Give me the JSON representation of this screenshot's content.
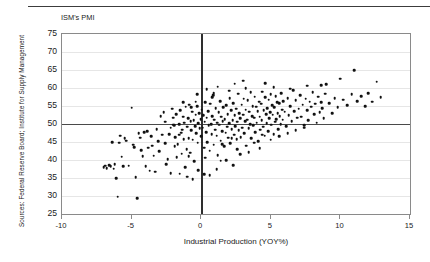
{
  "figure": {
    "source_note": "Sources: Federal Reserve Board; Institute for Supply Management",
    "title_label": "ISM's PMI"
  },
  "chart_data": {
    "type": "scatter",
    "title": "ISM's PMI",
    "xlabel": "Industrial Production (YOY%)",
    "ylabel": "ISM's PMI",
    "xlim": [
      -10,
      15
    ],
    "ylim": [
      25,
      75
    ],
    "xticks": [
      -10,
      -5,
      0,
      5,
      10,
      15
    ],
    "xtick_labels": [
      "-10",
      "-5",
      "0",
      "5",
      "10",
      "15"
    ],
    "yticks": [
      25,
      30,
      35,
      40,
      45,
      50,
      55,
      60,
      65,
      70,
      75
    ],
    "ytick_labels": [
      "25",
      "30",
      "35",
      "40",
      "45",
      "50",
      "55",
      "60",
      "65",
      "70",
      "75"
    ],
    "grid": "horizontal",
    "legend": "none",
    "reference_lines": [
      {
        "axis": "y",
        "value": 50
      },
      {
        "axis": "x",
        "value": 0
      }
    ],
    "marker": {
      "shape": "circle",
      "color": "#111111",
      "size": 2.6
    },
    "points": [
      [
        -7.0,
        38.0
      ],
      [
        -6.9,
        38.4
      ],
      [
        -6.8,
        37.8
      ],
      [
        -6.6,
        38.6
      ],
      [
        -6.5,
        38.2
      ],
      [
        -6.4,
        45.0
      ],
      [
        -6.3,
        37.6
      ],
      [
        -6.2,
        38.8
      ],
      [
        -6.1,
        35.0
      ],
      [
        -6.0,
        29.8
      ],
      [
        -5.9,
        44.8
      ],
      [
        -5.8,
        46.8
      ],
      [
        -5.7,
        40.9
      ],
      [
        -5.6,
        38.2
      ],
      [
        -5.5,
        46.0
      ],
      [
        -5.4,
        45.4
      ],
      [
        -5.2,
        38.4
      ],
      [
        -5.0,
        54.5
      ],
      [
        -4.9,
        44.2
      ],
      [
        -4.8,
        43.6
      ],
      [
        -4.7,
        35.2
      ],
      [
        -4.6,
        29.4
      ],
      [
        -4.5,
        47.4
      ],
      [
        -4.4,
        46.2
      ],
      [
        -4.3,
        42.8
      ],
      [
        -4.2,
        41.0
      ],
      [
        -4.1,
        47.8
      ],
      [
        -4.0,
        38.2
      ],
      [
        -3.9,
        48.0
      ],
      [
        -3.8,
        43.4
      ],
      [
        -3.7,
        37.0
      ],
      [
        -3.6,
        46.6
      ],
      [
        -3.5,
        44.0
      ],
      [
        -3.4,
        41.2
      ],
      [
        -3.3,
        36.8
      ],
      [
        -3.2,
        48.6
      ],
      [
        -3.1,
        45.2
      ],
      [
        -3.0,
        42.4
      ],
      [
        -2.9,
        52.2
      ],
      [
        -2.8,
        47.0
      ],
      [
        -2.7,
        53.2
      ],
      [
        -2.6,
        44.6
      ],
      [
        -2.5,
        38.8
      ],
      [
        -2.4,
        40.2
      ],
      [
        -2.3,
        47.2
      ],
      [
        -2.2,
        36.4
      ],
      [
        -2.1,
        54.2
      ],
      [
        -2.0,
        49.8
      ],
      [
        -1.95,
        49.6
      ],
      [
        -1.9,
        43.8
      ],
      [
        -1.85,
        46.4
      ],
      [
        -1.8,
        52.8
      ],
      [
        -1.75,
        40.8
      ],
      [
        -1.7,
        44.4
      ],
      [
        -1.6,
        50.0
      ],
      [
        -1.55,
        36.2
      ],
      [
        -1.5,
        53.8
      ],
      [
        -1.45,
        47.6
      ],
      [
        -1.4,
        41.8
      ],
      [
        -1.35,
        48.4
      ],
      [
        -1.3,
        52.0
      ],
      [
        -1.25,
        45.8
      ],
      [
        -1.2,
        50.4
      ],
      [
        -1.15,
        38.0
      ],
      [
        -1.1,
        54.8
      ],
      [
        -1.05,
        43.0
      ],
      [
        -1.0,
        49.2
      ],
      [
        -0.95,
        51.6
      ],
      [
        -0.9,
        46.0
      ],
      [
        -0.85,
        55.4
      ],
      [
        -0.8,
        42.0
      ],
      [
        -0.75,
        50.8
      ],
      [
        -0.7,
        48.2
      ],
      [
        -0.65,
        53.4
      ],
      [
        -0.6,
        45.6
      ],
      [
        -0.55,
        51.0
      ],
      [
        -0.5,
        39.6
      ],
      [
        -0.45,
        49.4
      ],
      [
        -0.4,
        52.6
      ],
      [
        -0.35,
        47.4
      ],
      [
        -0.3,
        55.0
      ],
      [
        -0.25,
        44.8
      ],
      [
        -0.2,
        50.2
      ],
      [
        -0.15,
        53.0
      ],
      [
        -0.1,
        48.8
      ],
      [
        -0.05,
        51.4
      ],
      [
        0.0,
        46.6
      ],
      [
        0.05,
        54.0
      ],
      [
        0.1,
        49.0
      ],
      [
        0.15,
        52.4
      ],
      [
        0.2,
        43.4
      ],
      [
        0.25,
        50.6
      ],
      [
        0.3,
        56.0
      ],
      [
        0.35,
        47.8
      ],
      [
        0.4,
        51.8
      ],
      [
        0.45,
        45.0
      ],
      [
        0.5,
        53.6
      ],
      [
        0.55,
        49.6
      ],
      [
        0.6,
        42.6
      ],
      [
        0.65,
        55.6
      ],
      [
        0.7,
        50.0
      ],
      [
        0.75,
        47.2
      ],
      [
        0.8,
        52.2
      ],
      [
        0.85,
        58.0
      ],
      [
        0.9,
        44.2
      ],
      [
        0.95,
        51.2
      ],
      [
        1.0,
        48.4
      ],
      [
        1.05,
        54.4
      ],
      [
        1.1,
        46.8
      ],
      [
        1.15,
        50.4
      ],
      [
        1.2,
        41.4
      ],
      [
        1.25,
        53.2
      ],
      [
        1.3,
        49.8
      ],
      [
        1.35,
        56.4
      ],
      [
        1.4,
        45.4
      ],
      [
        1.45,
        52.0
      ],
      [
        1.5,
        48.0
      ],
      [
        1.55,
        50.8
      ],
      [
        1.6,
        54.6
      ],
      [
        1.65,
        43.8
      ],
      [
        1.7,
        51.4
      ],
      [
        1.75,
        47.6
      ],
      [
        1.8,
        55.2
      ],
      [
        1.85,
        49.2
      ],
      [
        1.9,
        52.8
      ],
      [
        1.95,
        46.2
      ],
      [
        2.0,
        50.2
      ],
      [
        2.05,
        57.2
      ],
      [
        2.1,
        44.6
      ],
      [
        2.15,
        53.8
      ],
      [
        2.2,
        48.6
      ],
      [
        2.25,
        51.0
      ],
      [
        2.3,
        55.8
      ],
      [
        2.35,
        47.0
      ],
      [
        2.4,
        52.4
      ],
      [
        2.45,
        49.4
      ],
      [
        2.5,
        54.2
      ],
      [
        2.55,
        45.8
      ],
      [
        2.6,
        50.6
      ],
      [
        2.65,
        58.4
      ],
      [
        2.7,
        48.2
      ],
      [
        2.75,
        53.0
      ],
      [
        2.8,
        51.6
      ],
      [
        2.85,
        46.4
      ],
      [
        2.9,
        55.4
      ],
      [
        2.95,
        49.0
      ],
      [
        3.0,
        52.6
      ],
      [
        3.05,
        57.0
      ],
      [
        3.1,
        47.4
      ],
      [
        3.15,
        50.8
      ],
      [
        3.2,
        54.0
      ],
      [
        3.25,
        44.0
      ],
      [
        3.3,
        51.2
      ],
      [
        3.35,
        56.6
      ],
      [
        3.4,
        48.8
      ],
      [
        3.45,
        53.4
      ],
      [
        3.5,
        50.0
      ],
      [
        3.55,
        58.8
      ],
      [
        3.6,
        46.0
      ],
      [
        3.65,
        52.2
      ],
      [
        3.7,
        55.0
      ],
      [
        3.75,
        49.6
      ],
      [
        3.8,
        51.8
      ],
      [
        3.85,
        57.6
      ],
      [
        3.9,
        47.8
      ],
      [
        3.95,
        54.8
      ],
      [
        4.0,
        50.4
      ],
      [
        4.05,
        53.6
      ],
      [
        4.1,
        45.2
      ],
      [
        4.15,
        56.2
      ],
      [
        4.2,
        52.0
      ],
      [
        4.25,
        48.4
      ],
      [
        4.3,
        55.6
      ],
      [
        4.35,
        51.0
      ],
      [
        4.4,
        59.0
      ],
      [
        4.45,
        49.2
      ],
      [
        4.5,
        53.8
      ],
      [
        4.55,
        46.8
      ],
      [
        4.6,
        57.4
      ],
      [
        4.65,
        52.8
      ],
      [
        4.7,
        50.2
      ],
      [
        4.75,
        54.4
      ],
      [
        4.8,
        48.0
      ],
      [
        4.85,
        56.8
      ],
      [
        4.9,
        51.6
      ],
      [
        4.95,
        53.2
      ],
      [
        5.0,
        58.2
      ],
      [
        5.05,
        49.8
      ],
      [
        5.1,
        55.2
      ],
      [
        5.15,
        52.6
      ],
      [
        5.2,
        47.2
      ],
      [
        5.25,
        54.6
      ],
      [
        5.3,
        50.6
      ],
      [
        5.35,
        57.8
      ],
      [
        5.4,
        51.4
      ],
      [
        5.45,
        56.0
      ],
      [
        5.5,
        53.0
      ],
      [
        5.55,
        48.6
      ],
      [
        5.6,
        55.8
      ],
      [
        5.65,
        52.2
      ],
      [
        5.7,
        50.0
      ],
      [
        5.75,
        58.6
      ],
      [
        5.8,
        54.0
      ],
      [
        5.85,
        51.2
      ],
      [
        5.9,
        56.4
      ],
      [
        6.0,
        53.4
      ],
      [
        6.1,
        49.4
      ],
      [
        6.2,
        57.2
      ],
      [
        6.3,
        52.4
      ],
      [
        6.4,
        55.0
      ],
      [
        6.5,
        50.8
      ],
      [
        6.6,
        59.4
      ],
      [
        6.7,
        53.6
      ],
      [
        6.8,
        56.6
      ],
      [
        6.9,
        51.8
      ],
      [
        7.0,
        54.2
      ],
      [
        7.1,
        58.0
      ],
      [
        7.2,
        52.0
      ],
      [
        7.3,
        55.4
      ],
      [
        7.4,
        49.0
      ],
      [
        7.5,
        57.0
      ],
      [
        7.6,
        53.8
      ],
      [
        7.7,
        51.0
      ],
      [
        7.8,
        56.2
      ],
      [
        7.9,
        54.8
      ],
      [
        8.0,
        58.8
      ],
      [
        8.1,
        52.8
      ],
      [
        8.2,
        55.6
      ],
      [
        8.3,
        50.4
      ],
      [
        8.4,
        57.6
      ],
      [
        8.5,
        53.2
      ],
      [
        8.6,
        56.0
      ],
      [
        8.7,
        54.4
      ],
      [
        8.8,
        51.6
      ],
      [
        8.9,
        58.4
      ],
      [
        9.0,
        61.0
      ],
      [
        9.2,
        55.8
      ],
      [
        9.4,
        53.0
      ],
      [
        9.6,
        57.2
      ],
      [
        9.8,
        54.6
      ],
      [
        10.0,
        62.6
      ],
      [
        10.2,
        56.8
      ],
      [
        10.5,
        55.2
      ],
      [
        10.8,
        58.2
      ],
      [
        11.0,
        65.0
      ],
      [
        11.2,
        56.4
      ],
      [
        11.5,
        57.8
      ],
      [
        11.8,
        55.0
      ],
      [
        12.0,
        58.6
      ],
      [
        12.3,
        56.2
      ],
      [
        12.6,
        61.8
      ],
      [
        12.9,
        57.4
      ],
      [
        -2.2,
        49.0
      ],
      [
        -1.6,
        47.0
      ],
      [
        -0.9,
        41.0
      ],
      [
        -0.4,
        56.2
      ],
      [
        0.3,
        40.6
      ],
      [
        0.9,
        58.6
      ],
      [
        1.4,
        39.8
      ],
      [
        2.0,
        59.2
      ],
      [
        2.6,
        43.0
      ],
      [
        3.2,
        60.0
      ],
      [
        3.8,
        44.8
      ],
      [
        4.4,
        47.0
      ],
      [
        5.0,
        45.6
      ],
      [
        5.6,
        46.6
      ],
      [
        6.2,
        47.4
      ],
      [
        6.8,
        48.2
      ],
      [
        7.4,
        49.6
      ],
      [
        0.6,
        35.8
      ],
      [
        1.1,
        37.4
      ],
      [
        2.3,
        38.6
      ],
      [
        -0.2,
        37.2
      ],
      [
        0.2,
        36.0
      ],
      [
        1.8,
        40.0
      ],
      [
        2.8,
        41.6
      ],
      [
        3.4,
        42.2
      ],
      [
        4.2,
        43.2
      ],
      [
        -1.0,
        35.4
      ],
      [
        -0.6,
        34.6
      ],
      [
        1.5,
        44.4
      ],
      [
        2.2,
        46.0
      ],
      [
        -2.6,
        50.6
      ],
      [
        -2.0,
        51.8
      ],
      [
        -1.3,
        56.0
      ],
      [
        -0.7,
        54.6
      ],
      [
        5.2,
        60.2
      ],
      [
        6.4,
        59.8
      ],
      [
        7.6,
        60.6
      ],
      [
        4.6,
        61.4
      ],
      [
        3.0,
        62.0
      ],
      [
        2.4,
        61.2
      ],
      [
        1.2,
        60.4
      ],
      [
        0.4,
        59.6
      ],
      [
        0.8,
        57.4
      ],
      [
        -0.3,
        58.2
      ],
      [
        8.6,
        60.8
      ]
    ]
  }
}
